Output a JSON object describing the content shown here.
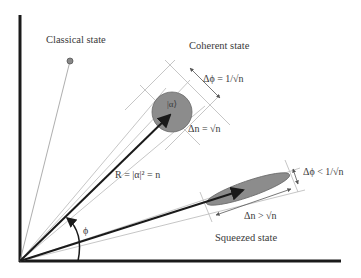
{
  "diagram": {
    "labels": {
      "classical": "Classical state",
      "coherent": "Coherent state",
      "squeezed": "Squeezed state",
      "ket": "|α⟩",
      "radius": "R = |α|² = n",
      "phi": "ϕ",
      "coherent_dphi": "Δϕ = 1/√n",
      "coherent_dn": "Δn = √n",
      "squeezed_dphi": "Δϕ < 1/√n",
      "squeezed_dn": "Δn > √n"
    },
    "colors": {
      "axis": "#1a1a1a",
      "state_fill": "#8c8c8c",
      "guide_line": "#b8b8b8",
      "text": "#3a3a3a"
    }
  }
}
